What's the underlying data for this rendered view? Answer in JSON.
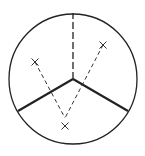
{
  "diagram": {
    "title": "",
    "background": "#ffffff",
    "stroke_color": "#222222",
    "circle": {
      "cx": 73,
      "cy": 79,
      "rx": 64,
      "ry": 65
    },
    "center": {
      "x": 73,
      "y": 79
    },
    "solid_spokes": [
      {
        "x2": 18,
        "y2": 111
      },
      {
        "x2": 128,
        "y2": 111
      }
    ],
    "dashed_spoke": {
      "x2": 73,
      "y2": 13
    },
    "markers": [
      {
        "label": "×",
        "x": 35,
        "y": 62
      },
      {
        "label": "×",
        "x": 103,
        "y": 45
      },
      {
        "label": "×",
        "x": 65,
        "y": 126
      }
    ],
    "v_vertex": {
      "x": 65,
      "y": 118
    }
  }
}
